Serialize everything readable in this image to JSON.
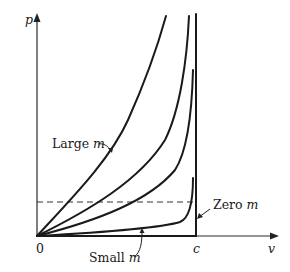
{
  "diagram": {
    "type": "relativistic momentum vs velocity curves",
    "axes": {
      "y_label": "p",
      "x_label": "v",
      "origin_label": "0",
      "x_mark_label": "c"
    },
    "annotations": {
      "large_m_text": "Large ",
      "large_m_var": "m",
      "small_m_text": "Small ",
      "small_m_var": "m",
      "zero_m_text": "Zero ",
      "zero_m_var": "m"
    },
    "curves": [
      {
        "name": "large-m",
        "description": "steepest curve, rises from origin toward top"
      },
      {
        "name": "medium-m-1",
        "description": "second curve, asymptote near c"
      },
      {
        "name": "medium-m-2",
        "description": "third curve, asymptote near c"
      },
      {
        "name": "small-m",
        "description": "nearly flat along v axis, sharp rise at c"
      },
      {
        "name": "zero-m",
        "description": "runs along v axis then vertical at c"
      }
    ],
    "dashed_line": {
      "description": "horizontal constant-p reference line"
    },
    "colors": {
      "ink": "#1a1a1a",
      "background": "#ffffff"
    }
  }
}
